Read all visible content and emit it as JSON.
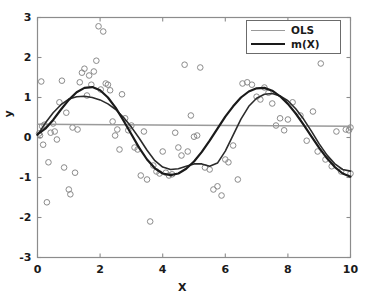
{
  "chart_data": {
    "type": "scatter",
    "title": "",
    "xlabel": "X",
    "ylabel": "y",
    "xlim": [
      0,
      10
    ],
    "ylim": [
      -3,
      3
    ],
    "xticks": [
      0,
      2,
      4,
      6,
      8,
      10
    ],
    "yticks": [
      -3,
      -2,
      -1,
      0,
      1,
      2,
      3
    ],
    "grid": false,
    "legend_position": "top-right",
    "legend": [
      {
        "label": "OLS",
        "color": "#9a9a9a",
        "style": "thin-line"
      },
      {
        "label": "m(X)",
        "color": "#1a1a1a",
        "style": "thick-line"
      }
    ],
    "marker": {
      "shape": "circle-open",
      "color": "#8a8a8a",
      "size": 4
    },
    "scatter": {
      "name": "observations",
      "x": [
        0.05,
        0.08,
        0.12,
        0.15,
        0.18,
        0.22,
        0.3,
        0.35,
        0.42,
        0.5,
        0.55,
        0.62,
        0.7,
        0.78,
        0.85,
        0.92,
        1.0,
        1.05,
        1.12,
        1.2,
        1.28,
        1.35,
        1.42,
        1.5,
        1.58,
        1.65,
        1.72,
        1.8,
        1.88,
        1.95,
        2.02,
        2.1,
        2.18,
        2.25,
        2.32,
        2.4,
        2.48,
        2.55,
        2.62,
        2.7,
        2.8,
        2.9,
        3.0,
        3.1,
        3.2,
        3.3,
        3.4,
        3.5,
        3.6,
        3.7,
        3.8,
        3.9,
        4.0,
        4.1,
        4.2,
        4.3,
        4.4,
        4.5,
        4.6,
        4.7,
        4.8,
        4.9,
        5.0,
        5.1,
        5.2,
        5.35,
        5.5,
        5.62,
        5.75,
        5.88,
        6.0,
        6.1,
        6.25,
        6.4,
        6.55,
        6.7,
        6.85,
        7.0,
        7.12,
        7.25,
        7.38,
        7.5,
        7.62,
        7.75,
        7.88,
        8.0,
        8.15,
        8.4,
        8.6,
        8.8,
        8.95,
        9.05,
        9.2,
        9.4,
        9.55,
        9.7,
        9.85,
        9.95,
        10.0,
        10.0
      ],
      "y": [
        0.1,
        0.05,
        1.4,
        0.28,
        -0.18,
        0.32,
        -1.62,
        -0.62,
        0.12,
        0.35,
        0.15,
        -0.05,
        0.88,
        1.42,
        -0.75,
        0.62,
        -1.3,
        -1.42,
        0.25,
        -0.88,
        0.2,
        1.38,
        1.62,
        1.72,
        1.05,
        1.55,
        1.32,
        1.65,
        1.92,
        2.78,
        1.2,
        2.65,
        1.35,
        1.32,
        1.18,
        0.4,
        0.05,
        0.2,
        -0.3,
        1.08,
        0.48,
        0.18,
        0.3,
        -0.25,
        -0.3,
        -0.95,
        0.15,
        -1.05,
        -2.1,
        -0.7,
        -0.85,
        -0.9,
        -0.35,
        -0.88,
        -0.95,
        -0.92,
        0.12,
        -0.25,
        -0.45,
        1.82,
        -0.35,
        0.55,
        0.02,
        0.05,
        1.75,
        -0.75,
        -0.8,
        -1.3,
        -1.22,
        -1.45,
        -0.55,
        -0.62,
        -0.2,
        -1.05,
        1.35,
        1.38,
        1.32,
        1.02,
        0.95,
        1.25,
        1.12,
        0.85,
        0.3,
        0.48,
        0.18,
        0.45,
        0.88,
        0.55,
        -0.08,
        0.65,
        -0.35,
        1.85,
        -0.55,
        -0.72,
        0.15,
        -0.85,
        0.2,
        0.18,
        0.25,
        -0.9
      ]
    },
    "series": [
      {
        "name": "OLS",
        "type": "line",
        "color": "#9a9a9a",
        "width": 1.4,
        "x": [
          0,
          10
        ],
        "y": [
          0.33,
          0.28
        ]
      },
      {
        "name": "m(X)",
        "type": "line",
        "color": "#1a1a1a",
        "width": 2.2,
        "description": "true regression curve, sine-like",
        "x": [
          0.0,
          0.25,
          0.5,
          0.75,
          1.0,
          1.25,
          1.5,
          1.75,
          2.0,
          2.25,
          2.5,
          2.75,
          3.0,
          3.25,
          3.5,
          3.75,
          4.0,
          4.25,
          4.5,
          4.75,
          5.0,
          5.25,
          5.5,
          5.75,
          6.0,
          6.25,
          6.5,
          6.75,
          7.0,
          7.25,
          7.5,
          7.75,
          8.0,
          8.25,
          8.5,
          8.75,
          9.0,
          9.25,
          9.5,
          9.75,
          10.0
        ],
        "y": [
          0.08,
          0.22,
          0.44,
          0.7,
          0.94,
          1.13,
          1.24,
          1.26,
          1.18,
          1.0,
          0.74,
          0.42,
          0.08,
          -0.26,
          -0.55,
          -0.77,
          -0.9,
          -0.94,
          -0.9,
          -0.78,
          -0.6,
          -0.36,
          -0.08,
          0.22,
          0.52,
          0.78,
          1.0,
          1.15,
          1.23,
          1.24,
          1.17,
          1.03,
          0.84,
          0.6,
          0.32,
          0.03,
          -0.26,
          -0.52,
          -0.74,
          -0.9,
          -0.98
        ]
      },
      {
        "name": "estimate",
        "type": "line",
        "color": "#2b2b2b",
        "width": 1.6,
        "description": "nonparametric fitted curve, wiggly",
        "x": [
          0.0,
          0.25,
          0.5,
          0.75,
          1.0,
          1.25,
          1.5,
          1.75,
          2.0,
          2.25,
          2.5,
          2.75,
          3.0,
          3.25,
          3.5,
          3.75,
          4.0,
          4.25,
          4.5,
          4.75,
          5.0,
          5.25,
          5.5,
          5.75,
          6.0,
          6.25,
          6.5,
          6.75,
          7.0,
          7.25,
          7.5,
          7.75,
          8.0,
          8.25,
          8.5,
          8.75,
          9.0,
          9.25,
          9.5,
          9.75,
          10.0
        ],
        "y": [
          0.06,
          0.36,
          0.62,
          0.82,
          0.96,
          1.02,
          1.03,
          1.0,
          0.94,
          0.84,
          0.7,
          0.5,
          0.26,
          -0.02,
          -0.32,
          -0.58,
          -0.74,
          -0.8,
          -0.78,
          -0.72,
          -0.66,
          -0.66,
          -0.72,
          -0.64,
          -0.34,
          0.06,
          0.46,
          0.78,
          0.98,
          1.08,
          1.1,
          1.04,
          0.92,
          0.72,
          0.46,
          0.16,
          -0.16,
          -0.44,
          -0.66,
          -0.8,
          -0.84
        ]
      }
    ]
  }
}
